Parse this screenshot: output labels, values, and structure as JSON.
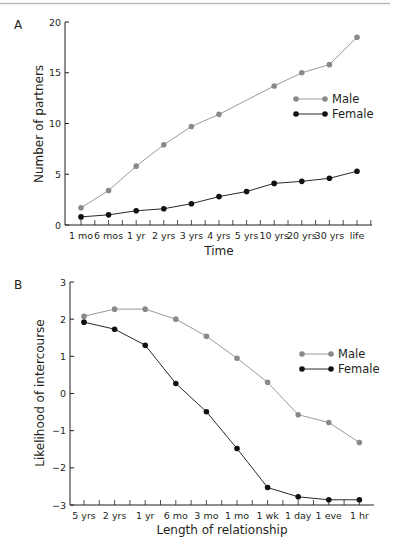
{
  "chart_data": [
    {
      "panel": "A",
      "type": "line",
      "title": "",
      "xlabel": "Time",
      "ylabel": "Number of partners",
      "categories": [
        "1 mo",
        "6 mos",
        "1 yr",
        "2 yrs",
        "3 yrs",
        "4 yrs",
        "5 yrs",
        "10 yrs",
        "20 yrs",
        "30 yrs",
        "life"
      ],
      "ylim": [
        0,
        20
      ],
      "yticks": [
        0,
        5,
        10,
        15,
        20
      ],
      "grid": false,
      "legend": "right",
      "series": [
        {
          "name": "Male",
          "color": "#8a8a8a",
          "values": [
            1.7,
            3.4,
            5.8,
            7.9,
            9.7,
            10.9,
            null,
            13.7,
            15.0,
            15.8,
            18.5
          ]
        },
        {
          "name": "Female",
          "color": "#111111",
          "values": [
            0.8,
            1.0,
            1.4,
            1.6,
            2.1,
            2.8,
            3.3,
            4.1,
            4.3,
            4.6,
            5.3
          ]
        }
      ]
    },
    {
      "panel": "B",
      "type": "line",
      "title": "",
      "xlabel": "Length of relationship",
      "ylabel": "Likelihood of intercourse",
      "categories": [
        "5 yrs",
        "2 yrs",
        "1 yr",
        "6 mo",
        "3 mo",
        "1 mo",
        "1 wk",
        "1 day",
        "1 eve",
        "1 hr"
      ],
      "ylim": [
        -3,
        3
      ],
      "yticks": [
        -3,
        -2,
        -1,
        0,
        1,
        2,
        3
      ],
      "ytick_labels": [
        "−3",
        "−2",
        "−1",
        "0",
        "1",
        "2",
        "3"
      ],
      "grid": false,
      "legend": "right",
      "series": [
        {
          "name": "Male",
          "color": "#8a8a8a",
          "values": [
            2.08,
            2.27,
            2.27,
            2.0,
            1.54,
            0.95,
            0.3,
            -0.57,
            -0.78,
            -1.32
          ]
        },
        {
          "name": "Female",
          "color": "#111111",
          "values": [
            1.92,
            1.73,
            1.3,
            0.27,
            -0.49,
            -1.48,
            -2.53,
            -2.78,
            -2.86,
            -2.86
          ]
        }
      ]
    }
  ]
}
